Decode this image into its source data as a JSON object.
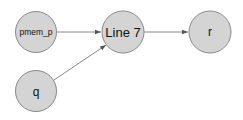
{
  "diagram": {
    "type": "directed-graph",
    "colors": {
      "node_fill": "#d4d4d4",
      "node_stroke": "#8a8a8a",
      "edge": "#6a6a6a",
      "background": "#ffffff"
    },
    "nodes": [
      {
        "id": "pmem_p",
        "label": "pmem_p"
      },
      {
        "id": "line7",
        "label": "Line 7"
      },
      {
        "id": "r",
        "label": "r"
      },
      {
        "id": "q",
        "label": "q"
      }
    ],
    "edges": [
      {
        "from": "pmem_p",
        "to": "line7"
      },
      {
        "from": "q",
        "to": "line7"
      },
      {
        "from": "line7",
        "to": "r"
      }
    ]
  }
}
